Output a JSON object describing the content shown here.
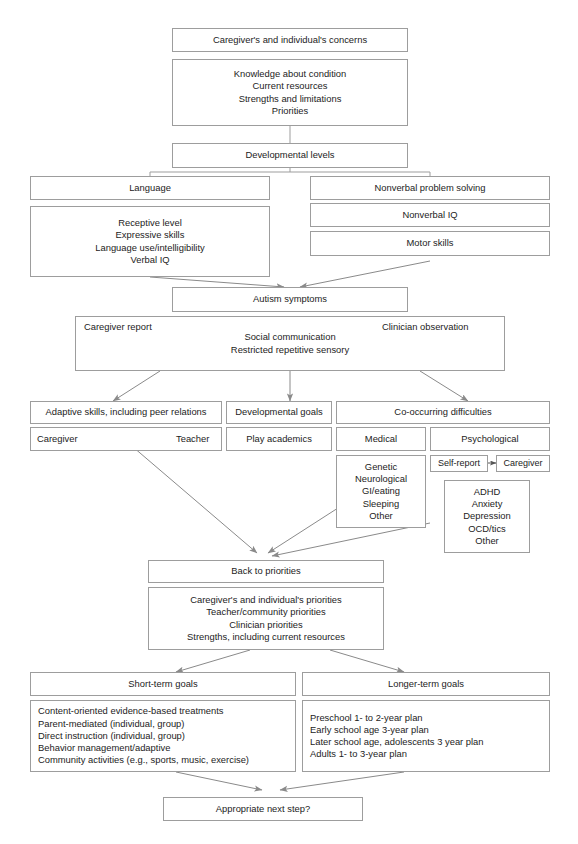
{
  "diagram": {
    "line_color": "#9d9d9d",
    "arrow_color": "#8a8a8a",
    "text_color": "#1c1c1c"
  },
  "nodes": {
    "concerns": {
      "label": "Caregiver's and individual's concerns"
    },
    "concerns_detail": {
      "lines": [
        "Knowledge about condition",
        "Current resources",
        "Strengths and limitations",
        "Priorities"
      ]
    },
    "dev_levels": {
      "label": "Developmental levels"
    },
    "language": {
      "label": "Language"
    },
    "language_detail": {
      "lines": [
        "Receptive level",
        "Expressive skills",
        "Language use/intelligibility",
        "Verbal IQ"
      ]
    },
    "nonverbal": {
      "label": "Nonverbal problem solving"
    },
    "nonverbal_iq": {
      "label": "Nonverbal IQ"
    },
    "motor_skills": {
      "label": "Motor skills"
    },
    "autism_symptoms": {
      "label": "Autism symptoms"
    },
    "symptoms_detail": {
      "left_label": "Caregiver report",
      "right_label": "Clinician observation",
      "lines": [
        "Social communication",
        "Restricted repetitive sensory"
      ]
    },
    "adaptive": {
      "label": "Adaptive skills, including peer relations"
    },
    "adaptive_detail": {
      "left_label": "Caregiver",
      "right_label": "Teacher"
    },
    "dev_goals": {
      "label": "Developmental goals"
    },
    "play_academics": {
      "label": "Play academics"
    },
    "cooccurring": {
      "label": "Co-occurring difficulties"
    },
    "medical": {
      "label": "Medical"
    },
    "medical_detail": {
      "lines": [
        "Genetic",
        "Neurological",
        "GI/eating",
        "Sleeping",
        "Other"
      ]
    },
    "psychological": {
      "label": "Psychological"
    },
    "self_report": {
      "label": "Self-report"
    },
    "caregiver_report": {
      "label": "Caregiver"
    },
    "psych_detail": {
      "lines": [
        "ADHD",
        "Anxiety",
        "Depression",
        "OCD/tics",
        "Other"
      ]
    },
    "back_to_priorities": {
      "label": "Back to priorities"
    },
    "priorities_detail": {
      "lines": [
        "Caregiver's and individual's priorities",
        "Teacher/community priorities",
        "Clinician priorities",
        "Strengths, including current resources"
      ]
    },
    "short_term": {
      "label": "Short-term goals"
    },
    "short_term_detail": {
      "lines": [
        "Content-oriented evidence-based treatments",
        "Parent-mediated (individual, group)",
        "Direct instruction (individual, group)",
        "Behavior management/adaptive",
        "Community activities (e.g., sports, music, exercise)"
      ]
    },
    "longer_term": {
      "label": "Longer-term goals"
    },
    "longer_term_detail": {
      "lines": [
        "Preschool 1- to 2-year plan",
        "Early school age 3-year plan",
        "Later school age, adolescents 3 year plan",
        "Adults 1- to 3-year plan"
      ]
    },
    "next_step": {
      "label": "Appropriate next step?"
    }
  }
}
